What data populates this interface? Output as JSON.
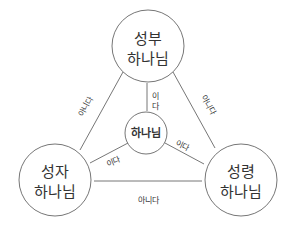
{
  "diagram": {
    "colors": {
      "stroke": "#555555",
      "text": "#333333",
      "background": "#ffffff"
    },
    "nodes": {
      "father": {
        "line1": "성부",
        "line2": "하나님"
      },
      "son": {
        "line1": "성자",
        "line2": "하나님"
      },
      "spirit": {
        "line1": "성령",
        "line2": "하나님"
      },
      "god": {
        "label": "하나님"
      }
    },
    "edges": {
      "father_son": "아니다",
      "father_spirit": "아니다",
      "son_spirit": "아니다",
      "father_god_1": "이",
      "father_god_2": "다",
      "son_god": "이다",
      "spirit_god": "이다"
    }
  }
}
